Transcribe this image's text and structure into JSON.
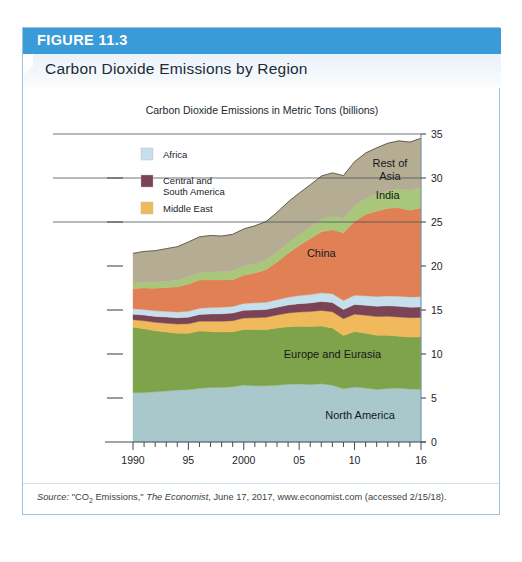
{
  "figure": {
    "number_label": "FIGURE 11.3",
    "title": "Carbon Dioxide Emissions by Region",
    "header_color": "#3a9bd9",
    "border_color": "#9dc3e0"
  },
  "source": {
    "prefix": "Source:",
    "quoted_title_pre": "\"CO",
    "quoted_title_sub": "2",
    "quoted_title_post": " Emissions,\"",
    "publication": "The Economist",
    "rest": ", June 17, 2017, www.economist.com (accessed 2/15/18)."
  },
  "legend": {
    "items": [
      {
        "label": "Africa",
        "color": "#c5dfed"
      },
      {
        "label": "Central and South America",
        "line1": "Central and",
        "line2": "South America",
        "color": "#7a4356"
      },
      {
        "label": "Middle East",
        "color": "#f0b95c"
      }
    ]
  },
  "inline_labels": [
    {
      "name": "rest-of-asia",
      "line1": "Rest of",
      "line2": "Asia"
    },
    {
      "name": "india",
      "line1": "India"
    },
    {
      "name": "china",
      "line1": "China"
    },
    {
      "name": "europe-and-eurasia",
      "line1": "Europe and Eurasia"
    },
    {
      "name": "north-america",
      "line1": "North America"
    }
  ],
  "chart_data": {
    "type": "area",
    "title": "Carbon Dioxide Emissions by Region",
    "subtitle": "Carbon Dioxide Emissions in Metric Tons (billions)",
    "xlabel": "",
    "ylabel": "",
    "ylim": [
      0,
      35
    ],
    "xlim": [
      1990,
      2016
    ],
    "grid": false,
    "stacked": true,
    "legend_position": "inside-top-left",
    "yticks": [
      0,
      5,
      10,
      15,
      20,
      25,
      30,
      35
    ],
    "ytick_labels": [
      "0",
      "5",
      "10",
      "15",
      "20",
      "25",
      "30",
      "35"
    ],
    "xticks": [
      1990,
      1995,
      2000,
      2005,
      2010,
      2016
    ],
    "xtick_labels": [
      "1990",
      "95",
      "2000",
      "05",
      "10",
      "16"
    ],
    "x": [
      1990,
      1991,
      1992,
      1993,
      1994,
      1995,
      1996,
      1997,
      1998,
      1999,
      2000,
      2001,
      2002,
      2003,
      2004,
      2005,
      2006,
      2007,
      2008,
      2009,
      2010,
      2011,
      2012,
      2013,
      2014,
      2015,
      2016
    ],
    "series": [
      {
        "name": "North America",
        "color": "#a8c8cc",
        "values": [
          5.6,
          5.62,
          5.7,
          5.8,
          5.9,
          5.95,
          6.1,
          6.2,
          6.2,
          6.28,
          6.48,
          6.38,
          6.4,
          6.45,
          6.55,
          6.6,
          6.52,
          6.62,
          6.45,
          6.05,
          6.25,
          6.15,
          5.98,
          6.08,
          6.12,
          6.02,
          5.98
        ]
      },
      {
        "name": "Europe and Eurasia",
        "color": "#7fa34a",
        "values": [
          7.45,
          7.25,
          6.95,
          6.7,
          6.45,
          6.4,
          6.5,
          6.35,
          6.3,
          6.25,
          6.3,
          6.4,
          6.35,
          6.5,
          6.55,
          6.55,
          6.6,
          6.55,
          6.5,
          6.05,
          6.3,
          6.2,
          6.15,
          6.05,
          5.9,
          5.9,
          5.95
        ]
      },
      {
        "name": "Middle East",
        "color": "#f0b95c",
        "values": [
          0.85,
          0.9,
          0.95,
          1.0,
          1.05,
          1.08,
          1.12,
          1.18,
          1.22,
          1.26,
          1.3,
          1.35,
          1.42,
          1.48,
          1.55,
          1.62,
          1.7,
          1.78,
          1.85,
          1.9,
          1.98,
          2.05,
          2.12,
          2.15,
          2.18,
          2.2,
          2.22
        ]
      },
      {
        "name": "Central and South America",
        "color": "#7a4356",
        "values": [
          0.62,
          0.65,
          0.67,
          0.7,
          0.72,
          0.75,
          0.78,
          0.82,
          0.85,
          0.86,
          0.88,
          0.88,
          0.88,
          0.88,
          0.92,
          0.95,
          0.98,
          1.02,
          1.06,
          1.05,
          1.1,
          1.14,
          1.18,
          1.2,
          1.22,
          1.2,
          1.18
        ]
      },
      {
        "name": "Africa",
        "color": "#c5dfed",
        "values": [
          0.62,
          0.64,
          0.64,
          0.65,
          0.66,
          0.68,
          0.7,
          0.72,
          0.74,
          0.75,
          0.78,
          0.8,
          0.82,
          0.85,
          0.88,
          0.92,
          0.95,
          0.98,
          1.0,
          1.02,
          1.05,
          1.08,
          1.1,
          1.12,
          1.15,
          1.16,
          1.18
        ]
      },
      {
        "name": "China",
        "color": "#e08054",
        "values": [
          2.3,
          2.45,
          2.55,
          2.7,
          2.85,
          3.1,
          3.2,
          3.15,
          3.1,
          3.05,
          3.2,
          3.4,
          3.7,
          4.3,
          5.0,
          5.7,
          6.35,
          6.95,
          7.25,
          7.7,
          8.4,
          9.25,
          9.7,
          9.95,
          10.05,
          9.85,
          10.1
        ]
      },
      {
        "name": "India",
        "color": "#a8c77a",
        "values": [
          0.6,
          0.64,
          0.68,
          0.72,
          0.76,
          0.82,
          0.86,
          0.9,
          0.94,
          1.0,
          1.02,
          1.05,
          1.08,
          1.12,
          1.18,
          1.24,
          1.32,
          1.42,
          1.52,
          1.65,
          1.72,
          1.82,
          1.95,
          2.0,
          2.15,
          2.25,
          2.35
        ]
      },
      {
        "name": "Rest of Asia",
        "color": "#b5ac94",
        "values": [
          3.4,
          3.5,
          3.6,
          3.7,
          3.8,
          3.95,
          4.05,
          4.15,
          4.05,
          4.15,
          4.25,
          4.3,
          4.4,
          4.5,
          4.65,
          4.7,
          4.8,
          4.9,
          4.95,
          4.85,
          5.05,
          5.15,
          5.25,
          5.4,
          5.45,
          5.5,
          5.55
        ]
      }
    ],
    "totals_endpoints": {
      "1990": 21.4,
      "2016": 33.5
    }
  }
}
